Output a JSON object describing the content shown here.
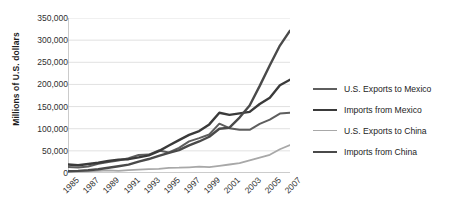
{
  "chart_data": {
    "type": "line",
    "title": "",
    "xlabel": "",
    "ylabel": "Millions of U.S. dollars",
    "ylim": [
      0,
      350000
    ],
    "yticks": [
      "0",
      "50,000",
      "100,000",
      "150,000",
      "200,000",
      "250,000",
      "300,000",
      "350,000"
    ],
    "ytick_values": [
      0,
      50000,
      100000,
      150000,
      200000,
      250000,
      300000,
      350000
    ],
    "grid": true,
    "legend_position": "right",
    "x": [
      1985,
      1986,
      1987,
      1988,
      1989,
      1990,
      1991,
      1992,
      1993,
      1994,
      1995,
      1996,
      1997,
      1998,
      1999,
      2000,
      2001,
      2002,
      2003,
      2004,
      2005,
      2006,
      2007
    ],
    "xticks": [
      "1985",
      "1987",
      "1989",
      "1991",
      "1993",
      "1995",
      "1997",
      "1999",
      "2001",
      "2003",
      "2005",
      "2007"
    ],
    "xtick_values": [
      1985,
      1987,
      1989,
      1991,
      1993,
      1995,
      1997,
      1999,
      2001,
      2003,
      2005,
      2007
    ],
    "series": [
      {
        "name": "U.S. Exports to Mexico",
        "color": "#5e5e5e",
        "width": 2.0,
        "values": [
          13635,
          12392,
          14582,
          20628,
          24982,
          28279,
          33277,
          40592,
          41581,
          50844,
          46292,
          56792,
          71388,
          78773,
          86909,
          111349,
          101297,
          97470,
          97412,
          110835,
          120365,
          134172,
          136092
        ]
      },
      {
        "name": "Imports from Mexico",
        "color": "#3a3a3a",
        "width": 2.4,
        "values": [
          19132,
          17558,
          20271,
          23260,
          27162,
          30157,
          31194,
          35211,
          39917,
          49494,
          62101,
          74297,
          85938,
          94629,
          109721,
          135926,
          131338,
          134616,
          138060,
          155902,
          170109,
          198253,
          210714
        ]
      },
      {
        "name": "U.S. Exports to China",
        "color": "#a8a8a8",
        "width": 1.8,
        "values": [
          3856,
          3106,
          3497,
          5017,
          5755,
          4807,
          6278,
          7470,
          8763,
          9282,
          11754,
          11993,
          12862,
          14241,
          13111,
          16185,
          19182,
          22128,
          28368,
          34744,
          41192,
          53673,
          62937
        ]
      },
      {
        "name": "Imports from China",
        "color": "#4a4a4a",
        "width": 2.4,
        "values": [
          3862,
          4771,
          6294,
          8511,
          11990,
          15237,
          18969,
          25728,
          31540,
          38787,
          45543,
          51513,
          62558,
          71169,
          81788,
          100018,
          102278,
          125193,
          152436,
          196682,
          243470,
          287774,
          321443
        ]
      }
    ]
  },
  "legend": {
    "items": [
      {
        "label": "U.S. Exports to Mexico"
      },
      {
        "label": "Imports from Mexico"
      },
      {
        "label": "U.S. Exports to China"
      },
      {
        "label": "Imports from China"
      }
    ]
  },
  "axis": {
    "y_title": "Millions of U.S. dollars"
  }
}
